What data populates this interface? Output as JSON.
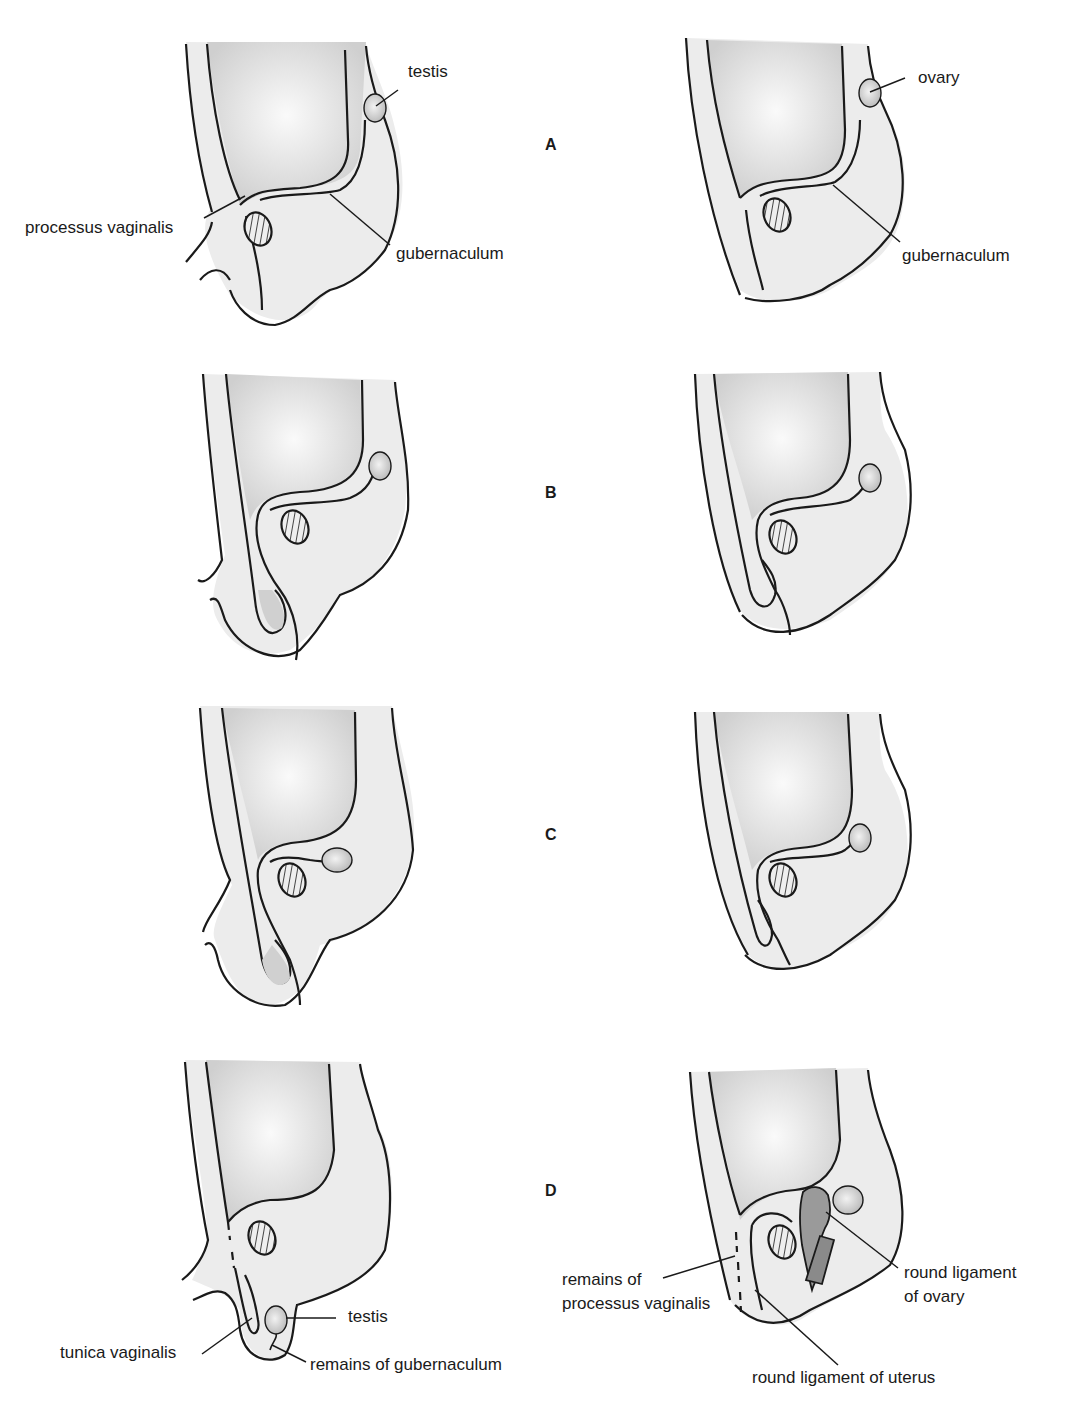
{
  "figure": {
    "colors": {
      "outline": "#1a1a1a",
      "tissue_fill": "#ececec",
      "cavity_fill": "#d4d4d4",
      "gonad_fill": "#c8c8c8",
      "ligament_fill": "#8a8a8a",
      "background": "#ffffff"
    }
  },
  "stages": [
    {
      "id": "A",
      "label": "A"
    },
    {
      "id": "B",
      "label": "B"
    },
    {
      "id": "C",
      "label": "C"
    },
    {
      "id": "D",
      "label": "D"
    }
  ],
  "labels": {
    "A_male_testis": "testis",
    "A_male_processus": "processus vaginalis",
    "A_male_gubernaculum": "gubernaculum",
    "A_female_ovary": "ovary",
    "A_female_gubernaculum": "gubernaculum",
    "D_male_testis": "testis",
    "D_male_tunica": "tunica vaginalis",
    "D_male_remains_gub": "remains of gubernaculum",
    "D_female_remains_pv_1": "remains of",
    "D_female_remains_pv_2": "processus vaginalis",
    "D_female_round_lig_ovary_1": "round ligament",
    "D_female_round_lig_ovary_2": "of ovary",
    "D_female_round_lig_uterus": "round ligament of uterus"
  }
}
